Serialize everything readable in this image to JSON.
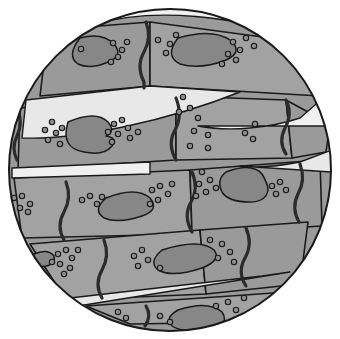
{
  "figure": {
    "view": "circular-microscope-field",
    "canvas": {
      "width": 340,
      "height": 339
    },
    "field": {
      "cx": 170,
      "cy": 170,
      "rx": 161,
      "ry": 161
    }
  },
  "colors": {
    "background": "#ffffff",
    "outline": "#1a1a1a",
    "fiber_fill": "#9a9a9a",
    "fiber_fill_alt": "#a2a2a2",
    "endomysium_band": "#f0f0f0",
    "endomysium_band_alt": "#e8e8e8",
    "nucleus_fill": "#878787",
    "organelle_fill": "#8d8d8d",
    "intercalated_disc": "#2b2b2b"
  },
  "legend_labels": {
    "fiber": "muscle-fiber",
    "nucleus": "nucleus",
    "organelle": "organelle-granule",
    "disc": "intercalated-disc",
    "band": "connective-tissue-band",
    "field_edge": "field-of-view-edge"
  },
  "fibers": [
    {
      "id": "fiber-row1-left",
      "path": "M 48 30 L 150 22 L 150 86 L 40 96 Z"
    },
    {
      "id": "fiber-row1-right",
      "path": "M 150 22 L 300 42 L 320 96 L 150 86 Z"
    },
    {
      "id": "fiber-row2-left",
      "path": "M 20 108 L 176 96 L 176 160 L 18 170 Z"
    },
    {
      "id": "fiber-row2-mid",
      "path": "M 176 96 L 286 100 L 292 158 L 176 160 Z"
    },
    {
      "id": "fiber-row2-right",
      "path": "M 286 100 L 330 124 L 326 152 L 292 158 Z"
    },
    {
      "id": "fiber-row3-left",
      "path": "M 14 178 L 190 170 L 192 234 L 22 238 Z"
    },
    {
      "id": "fiber-row3-right",
      "path": "M 190 170 L 320 160 L 322 226 L 192 234 Z"
    },
    {
      "id": "fiber-row4-left",
      "path": "M 30 244 L 200 230 L 206 294 L 66 300 Z"
    },
    {
      "id": "fiber-row4-right",
      "path": "M 200 230 L 308 222 L 300 284 L 206 294 Z"
    },
    {
      "id": "fiber-row5",
      "path": "M 86 306 L 288 292 L 262 322 L 130 324 Z"
    }
  ],
  "bands": [
    {
      "id": "band-top",
      "path": "M 96 24 C 150 8 240 14 300 42 L 300 36 C 238 6 148 2 96 20 Z"
    },
    {
      "id": "band-upper-left",
      "path": "M 26 100 L 150 86 L 240 92 C 170 120 80 140 22 138 Z"
    },
    {
      "id": "band-right-1",
      "path": "M 330 92 L 300 118 C 270 128 230 132 198 126 L 330 126 Z"
    },
    {
      "id": "band-right-2",
      "path": "M 332 150 L 300 162 C 280 166 258 168 240 166 L 332 172 Z"
    },
    {
      "id": "band-mid-left",
      "path": "M 12 168 L 150 162 L 150 174 L 12 178 Z"
    },
    {
      "id": "band-lower",
      "path": "M 70 298 L 262 276 L 290 272 L 78 306 Z"
    }
  ],
  "discs": [
    {
      "id": "disc-1",
      "path": "M 146 22 q 6 16 -2 30 q -8 14 0 30 l 0 6"
    },
    {
      "id": "disc-2",
      "path": "M 176 98 q 7 18 -1 32 q -8 14 1 30"
    },
    {
      "id": "disc-3",
      "path": "M 286 100 q 7 14 -1 28 q -7 14 1 26"
    },
    {
      "id": "disc-4",
      "path": "M 66 182 q 6 16 -2 30 q -8 14 0 28"
    },
    {
      "id": "disc-5",
      "path": "M 192 172 q 7 16 -1 30 q -8 14 1 30"
    },
    {
      "id": "disc-6",
      "path": "M 300 164 q 6 16 -2 30 q -7 14 1 28"
    },
    {
      "id": "disc-7",
      "path": "M 104 240 q 6 16 -2 30 q -8 14 0 28"
    },
    {
      "id": "disc-8",
      "path": "M 246 228 q 7 16 -1 30 q -8 14 1 28"
    },
    {
      "id": "disc-9",
      "path": "M 146 306 q 6 10 -1 20"
    },
    {
      "id": "disc-10",
      "path": "M 18 110 q 5 14 -1 26 q -6 12 0 24"
    },
    {
      "id": "disc-11",
      "path": "M 304 46 q 5 12 -1 22"
    }
  ],
  "nuclei": [
    {
      "id": "nucleus-1",
      "path": "M 80 38 q 22 -6 34 6 q 10 12 -6 18 q -18 8 -30 2 q -12 -8 2 -26 Z"
    },
    {
      "id": "nucleus-2",
      "path": "M 178 38 q 34 -10 52 2 q 14 12 -4 20 q -26 10 -46 4 q -16 -8 -2 -26 Z"
    },
    {
      "id": "nucleus-3",
      "path": "M 68 122 q 28 -12 40 0 q 8 10 -2 14 q 12 2 6 10 q -8 10 -28 6 q -24 -4 -16 -30 Z"
    },
    {
      "id": "nucleus-4",
      "path": "M 106 198 q 30 -12 44 0 q 10 12 -8 18 q -24 8 -38 2 q -12 -8 2 -20 Z"
    },
    {
      "id": "nucleus-5",
      "path": "M 226 172 q 26 -10 36 2 q 6 10 6 16 q -2 12 -18 12 q -22 0 -28 -10 q -6 -12 4 -20 Z"
    },
    {
      "id": "nucleus-6",
      "path": "M 162 250 q 38 -12 52 0 q 8 10 -12 18 q -30 10 -44 2 q -10 -8 4 -20 Z"
    },
    {
      "id": "nucleus-7",
      "path": "M 178 310 q 30 -10 44 2 q 8 12 -10 16 q -28 6 -40 -2 q -8 -8 6 -16 Z"
    },
    {
      "id": "nucleus-8",
      "path": "M 34 254 q 14 -6 20 2 q 2 8 -8 10 q -14 2 -16 -4 q 0 -6 4 -8 Z"
    }
  ],
  "organelles": [
    {
      "x": 113,
      "y": 43
    },
    {
      "x": 122,
      "y": 50
    },
    {
      "x": 81,
      "y": 49
    },
    {
      "x": 118,
      "y": 57
    },
    {
      "x": 127,
      "y": 42
    },
    {
      "x": 111,
      "y": 62
    },
    {
      "x": 158,
      "y": 40
    },
    {
      "x": 170,
      "y": 44
    },
    {
      "x": 166,
      "y": 53
    },
    {
      "x": 176,
      "y": 35
    },
    {
      "x": 233,
      "y": 42
    },
    {
      "x": 240,
      "y": 50
    },
    {
      "x": 228,
      "y": 54
    },
    {
      "x": 236,
      "y": 60
    },
    {
      "x": 222,
      "y": 64
    },
    {
      "x": 246,
      "y": 38
    },
    {
      "x": 254,
      "y": 46
    },
    {
      "x": 183,
      "y": 97
    },
    {
      "x": 190,
      "y": 108
    },
    {
      "x": 198,
      "y": 118
    },
    {
      "x": 179,
      "y": 112
    },
    {
      "x": 194,
      "y": 131
    },
    {
      "x": 208,
      "y": 135
    },
    {
      "x": 245,
      "y": 133
    },
    {
      "x": 253,
      "y": 139
    },
    {
      "x": 255,
      "y": 124
    },
    {
      "x": 190,
      "y": 146
    },
    {
      "x": 208,
      "y": 148
    },
    {
      "x": 52,
      "y": 122
    },
    {
      "x": 45,
      "y": 130
    },
    {
      "x": 56,
      "y": 133
    },
    {
      "x": 62,
      "y": 128
    },
    {
      "x": 48,
      "y": 140
    },
    {
      "x": 60,
      "y": 144
    },
    {
      "x": 114,
      "y": 124
    },
    {
      "x": 122,
      "y": 120
    },
    {
      "x": 128,
      "y": 128
    },
    {
      "x": 118,
      "y": 134
    },
    {
      "x": 130,
      "y": 138
    },
    {
      "x": 138,
      "y": 132
    },
    {
      "x": 112,
      "y": 142
    },
    {
      "x": 108,
      "y": 132
    },
    {
      "x": 14,
      "y": 198
    },
    {
      "x": 22,
      "y": 196
    },
    {
      "x": 30,
      "y": 204
    },
    {
      "x": 20,
      "y": 208
    },
    {
      "x": 28,
      "y": 212
    },
    {
      "x": 82,
      "y": 200
    },
    {
      "x": 90,
      "y": 196
    },
    {
      "x": 97,
      "y": 204
    },
    {
      "x": 102,
      "y": 197
    },
    {
      "x": 152,
      "y": 190
    },
    {
      "x": 160,
      "y": 186
    },
    {
      "x": 168,
      "y": 194
    },
    {
      "x": 158,
      "y": 200
    },
    {
      "x": 172,
      "y": 184
    },
    {
      "x": 150,
      "y": 204
    },
    {
      "x": 202,
      "y": 172
    },
    {
      "x": 210,
      "y": 180
    },
    {
      "x": 199,
      "y": 184
    },
    {
      "x": 216,
      "y": 188
    },
    {
      "x": 206,
      "y": 192
    },
    {
      "x": 196,
      "y": 196
    },
    {
      "x": 272,
      "y": 186
    },
    {
      "x": 280,
      "y": 182
    },
    {
      "x": 276,
      "y": 194
    },
    {
      "x": 286,
      "y": 190
    },
    {
      "x": 58,
      "y": 254
    },
    {
      "x": 66,
      "y": 250
    },
    {
      "x": 72,
      "y": 258
    },
    {
      "x": 60,
      "y": 264
    },
    {
      "x": 70,
      "y": 268
    },
    {
      "x": 52,
      "y": 262
    },
    {
      "x": 78,
      "y": 250
    },
    {
      "x": 64,
      "y": 274
    },
    {
      "x": 134,
      "y": 256
    },
    {
      "x": 142,
      "y": 250
    },
    {
      "x": 148,
      "y": 260
    },
    {
      "x": 138,
      "y": 266
    },
    {
      "x": 160,
      "y": 268
    },
    {
      "x": 210,
      "y": 240
    },
    {
      "x": 222,
      "y": 244
    },
    {
      "x": 230,
      "y": 252
    },
    {
      "x": 218,
      "y": 258
    },
    {
      "x": 234,
      "y": 262
    },
    {
      "x": 118,
      "y": 312
    },
    {
      "x": 126,
      "y": 318
    },
    {
      "x": 160,
      "y": 316
    },
    {
      "x": 170,
      "y": 322
    },
    {
      "x": 228,
      "y": 302
    },
    {
      "x": 236,
      "y": 310
    },
    {
      "x": 244,
      "y": 298
    },
    {
      "x": 216,
      "y": 306
    }
  ]
}
